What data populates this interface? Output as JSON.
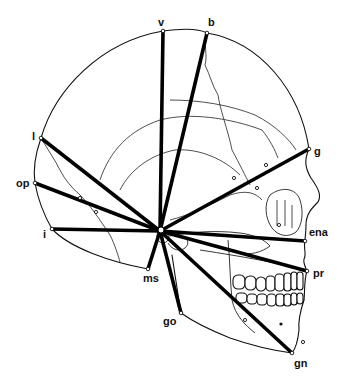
{
  "diagram": {
    "center": {
      "x": 160,
      "y": 231
    },
    "landmarks": [
      {
        "id": "v",
        "label": "v",
        "x": 163,
        "y": 31,
        "lx": 158,
        "ly": 26
      },
      {
        "id": "b",
        "label": "b",
        "x": 207,
        "y": 33,
        "lx": 208,
        "ly": 26
      },
      {
        "id": "l",
        "label": "l",
        "x": 41,
        "y": 138,
        "lx": 32,
        "ly": 140
      },
      {
        "id": "op",
        "label": "op",
        "x": 35,
        "y": 183,
        "lx": 16,
        "ly": 187
      },
      {
        "id": "i",
        "label": "i",
        "x": 52,
        "y": 229,
        "lx": 43,
        "ly": 238
      },
      {
        "id": "g",
        "label": "g",
        "x": 309,
        "y": 149,
        "lx": 314,
        "ly": 155
      },
      {
        "id": "ena",
        "label": "ena",
        "x": 305,
        "y": 241,
        "lx": 309,
        "ly": 236
      },
      {
        "id": "pr",
        "label": "pr",
        "x": 307,
        "y": 271,
        "lx": 313,
        "ly": 277
      },
      {
        "id": "gn",
        "label": "gn",
        "x": 292,
        "y": 353,
        "lx": 294,
        "ly": 367
      },
      {
        "id": "go",
        "label": "go",
        "x": 181,
        "y": 313,
        "lx": 163,
        "ly": 325
      },
      {
        "id": "ms",
        "label": "ms",
        "x": 148,
        "y": 269,
        "lx": 143,
        "ly": 282
      }
    ],
    "colors": {
      "line": "#000000",
      "background": "#ffffff"
    }
  }
}
